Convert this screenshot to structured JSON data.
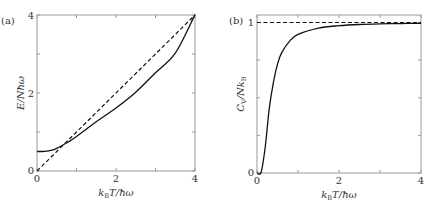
{
  "chart_data": [
    {
      "panel": "(a)",
      "type": "line",
      "xlabel": "k_B T/ħω",
      "ylabel": "E/Nħω",
      "xlim": [
        0,
        4
      ],
      "ylim": [
        0,
        4
      ],
      "xticks": [
        0,
        2,
        4
      ],
      "yticks": [
        0,
        2,
        4
      ],
      "minor_xticks": [
        1,
        3
      ],
      "minor_yticks": [
        1,
        3
      ],
      "grid": false,
      "series": [
        {
          "name": "quantum (Einstein model)",
          "style": "solid",
          "x": [
            0,
            0.1,
            0.2,
            0.3,
            0.4,
            0.5,
            0.6,
            0.8,
            1.0,
            1.5,
            2.0,
            2.5,
            3.0,
            3.5,
            4.0
          ],
          "y": [
            0.5,
            0.5,
            0.503,
            0.518,
            0.541,
            0.582,
            0.635,
            0.75,
            0.885,
            1.263,
            1.615,
            2.02,
            2.52,
            3.02,
            4.01
          ]
        },
        {
          "name": "classical limit",
          "style": "dashed",
          "x": [
            0,
            4
          ],
          "y": [
            0,
            4
          ]
        }
      ]
    },
    {
      "panel": "(b)",
      "type": "line",
      "xlabel": "k_B T/ħω",
      "ylabel": "C_V/Nk_B",
      "xlim": [
        0,
        4
      ],
      "ylim": [
        0,
        1.05
      ],
      "xticks": [
        0,
        2,
        4
      ],
      "yticks": [
        0,
        1
      ],
      "minor_xticks": [
        1,
        3
      ],
      "minor_yticks": [
        0.25,
        0.5,
        0.75
      ],
      "grid": false,
      "series": [
        {
          "name": "quantum (Einstein model)",
          "style": "solid",
          "x": [
            0,
            0.1,
            0.2,
            0.3,
            0.4,
            0.5,
            0.6,
            0.8,
            1.0,
            1.5,
            2.0,
            2.5,
            3.0,
            3.5,
            4.0
          ],
          "y": [
            0,
            0.005,
            0.171,
            0.431,
            0.603,
            0.724,
            0.798,
            0.878,
            0.921,
            0.963,
            0.979,
            0.987,
            0.991,
            0.993,
            0.995
          ]
        },
        {
          "name": "classical limit (Dulong-Petit)",
          "style": "dashed",
          "x": [
            0,
            4
          ],
          "y": [
            1,
            1
          ]
        }
      ]
    }
  ],
  "panels": {
    "a": {
      "label": "(a)",
      "ylabel": "E/Nħω",
      "xlabel_main": "k",
      "xlabel_sub": "B",
      "xlabel_rest": "T/ħω",
      "xtick_labels": [
        "0",
        "2",
        "4"
      ],
      "ytick_labels": [
        "0",
        "2",
        "4"
      ]
    },
    "b": {
      "label": "(b)",
      "ylabel_main": "C",
      "ylabel_sub1": "V",
      "ylabel_mid": "/Nk",
      "ylabel_sub2": "B",
      "xlabel_main": "k",
      "xlabel_sub": "B",
      "xlabel_rest": "T/ħω",
      "xtick_labels": [
        "0",
        "2",
        "4"
      ],
      "ytick_labels": [
        "0",
        "1"
      ]
    }
  },
  "colors": {
    "axis": "#9a9a9a",
    "curve": "#111111",
    "text": "#333333"
  }
}
